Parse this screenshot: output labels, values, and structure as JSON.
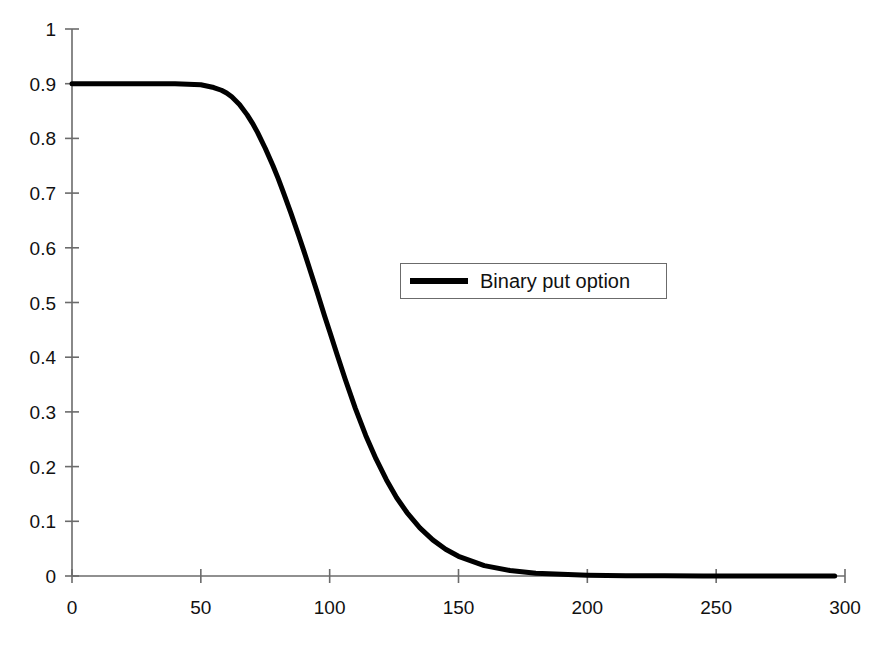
{
  "chart_data": {
    "type": "line",
    "title": "",
    "subtitle": "",
    "xlabel": "",
    "ylabel": "",
    "xlim": [
      0,
      300
    ],
    "ylim": [
      0,
      1
    ],
    "grid": false,
    "legend_position": "center-right",
    "x_ticks": [
      0,
      50,
      100,
      150,
      200,
      250,
      300
    ],
    "x_tick_labels": [
      "0",
      "50",
      "100",
      "150",
      "200",
      "250",
      "300"
    ],
    "y_ticks": [
      0,
      0.1,
      0.2,
      0.3,
      0.4,
      0.5,
      0.6,
      0.7,
      0.8,
      0.9,
      1
    ],
    "y_tick_labels": [
      "0",
      "0.1",
      "0.2",
      "0.3",
      "0.4",
      "0.5",
      "0.6",
      "0.7",
      "0.8",
      "0.9",
      "1"
    ],
    "series": [
      {
        "name": "Binary put option",
        "color": "#000000",
        "line_width": 5,
        "x": [
          0,
          5,
          10,
          15,
          20,
          25,
          30,
          35,
          40,
          45,
          50,
          55,
          58,
          60,
          62,
          65,
          68,
          70,
          72,
          75,
          78,
          80,
          82,
          85,
          88,
          90,
          92,
          95,
          98,
          100,
          103,
          106,
          110,
          114,
          118,
          122,
          126,
          130,
          135,
          140,
          145,
          150,
          160,
          170,
          180,
          190,
          200,
          215,
          230,
          245,
          260,
          275,
          290,
          296
        ],
        "y": [
          0.9,
          0.9,
          0.9,
          0.9,
          0.9,
          0.9,
          0.9,
          0.9,
          0.9,
          0.899,
          0.898,
          0.893,
          0.888,
          0.883,
          0.876,
          0.862,
          0.843,
          0.828,
          0.811,
          0.782,
          0.75,
          0.727,
          0.702,
          0.663,
          0.622,
          0.594,
          0.565,
          0.521,
          0.476,
          0.447,
          0.403,
          0.36,
          0.306,
          0.257,
          0.214,
          0.176,
          0.143,
          0.116,
          0.088,
          0.066,
          0.049,
          0.036,
          0.019,
          0.01,
          0.005,
          0.003,
          0.0015,
          0.0006,
          0.0003,
          0.0002,
          0.0001,
          0.0001,
          0.0,
          0.0
        ]
      }
    ],
    "legend": [
      {
        "label": "Binary put option",
        "color": "#000000"
      }
    ],
    "axis_color": "#6b6b6b"
  },
  "legend": {
    "entry_label": "Binary put option"
  }
}
